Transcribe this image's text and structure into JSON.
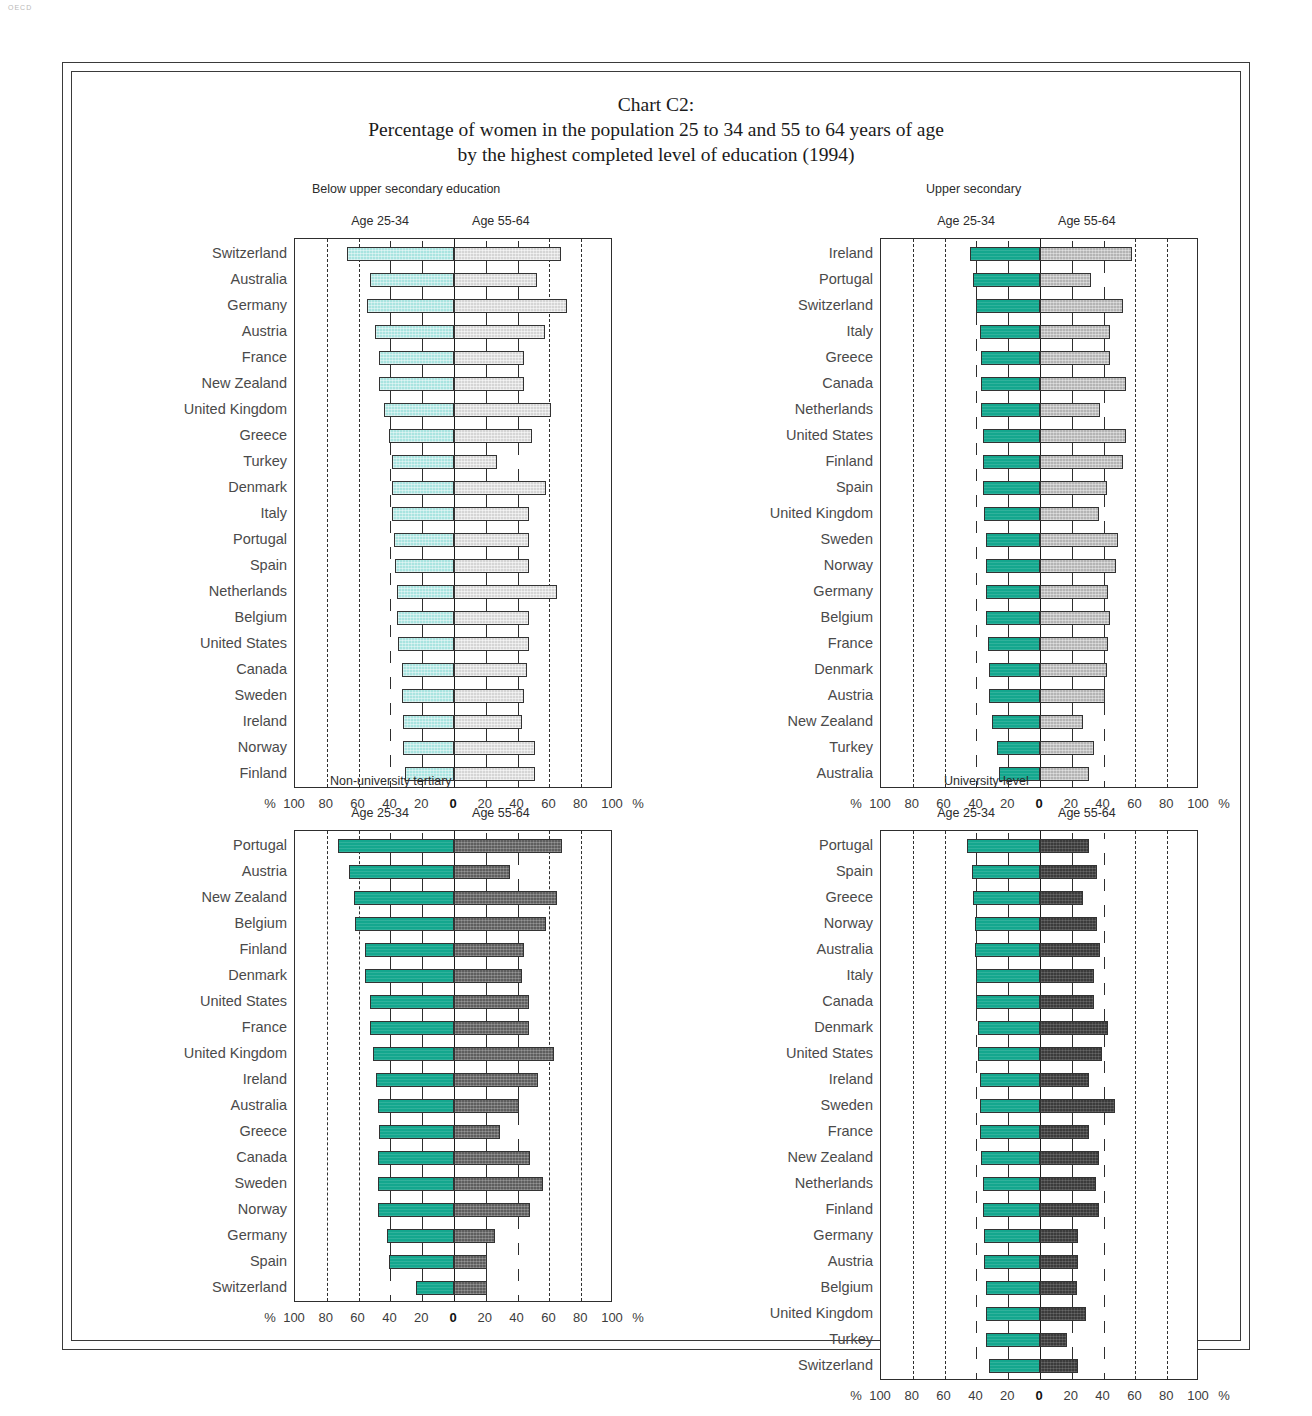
{
  "corner_mark": "OECD",
  "title": {
    "line1": "Chart C2:",
    "line2": "Percentage of women in the population 25 to 34 and 55 to 64 years of age",
    "line3": "by the highest completed level of education (1994)"
  },
  "axis": {
    "unit_left": "%",
    "unit_right": "%",
    "ticks": [
      "100",
      "80",
      "60",
      "40",
      "20",
      "0",
      "20",
      "40",
      "60",
      "80",
      "100"
    ],
    "tick_values": [
      -100,
      -80,
      -60,
      -40,
      -20,
      0,
      20,
      40,
      60,
      80,
      100
    ]
  },
  "legend": {
    "left": "Age 25-34",
    "right": "Age 55-64"
  },
  "colors": {
    "left_light": "#a9e4e0",
    "right_light": "#d5d5d5",
    "left_teal": "#14a78e",
    "right_mid": "#b4b4b4",
    "right_dark": "#5e5e5e",
    "right_very_dark": "#3b3b3b",
    "frame": "#3a3a3a",
    "label": "#4a4a4a"
  },
  "chart_data": [
    {
      "type": "bar",
      "orientation": "horizontal-diverging",
      "panel": "top-left",
      "title": "Below upper secondary education",
      "xlabel": "%",
      "ylabel": "",
      "xlim": [
        -100,
        100
      ],
      "grid": "dashed vertical at 20% steps",
      "legend_position": "above-plot",
      "left_series": {
        "name": "Age 25-34",
        "color": "#a9e4e0"
      },
      "right_series": {
        "name": "Age 55-64",
        "color": "#d5d5d5"
      },
      "categories": [
        "Switzerland",
        "Australia",
        "Germany",
        "Austria",
        "France",
        "New Zealand",
        "United Kingdom",
        "Greece",
        "Turkey",
        "Denmark",
        "Italy",
        "Portugal",
        "Spain",
        "Netherlands",
        "Belgium",
        "United States",
        "Canada",
        "Sweden",
        "Ireland",
        "Norway",
        "Finland"
      ],
      "age_25_34": [
        67,
        53,
        55,
        50,
        47,
        47,
        44,
        41,
        39,
        39,
        39,
        38,
        37,
        36,
        36,
        35,
        33,
        33,
        32,
        32,
        31
      ],
      "age_55_64": [
        67,
        52,
        71,
        57,
        44,
        44,
        61,
        49,
        27,
        58,
        47,
        47,
        47,
        65,
        47,
        47,
        46,
        44,
        43,
        51,
        51
      ]
    },
    {
      "type": "bar",
      "orientation": "horizontal-diverging",
      "panel": "top-right",
      "title": "Upper secondary",
      "xlabel": "%",
      "ylabel": "",
      "xlim": [
        -100,
        100
      ],
      "grid": "dashed vertical at 20% steps",
      "legend_position": "above-plot",
      "left_series": {
        "name": "Age 25-34",
        "color": "#14a78e"
      },
      "right_series": {
        "name": "Age 55-64",
        "color": "#b4b4b4"
      },
      "categories": [
        "Ireland",
        "Portugal",
        "Switzerland",
        "Italy",
        "Greece",
        "Canada",
        "Netherlands",
        "United States",
        "Finland",
        "Spain",
        "United Kingdom",
        "Sweden",
        "Norway",
        "Germany",
        "Belgium",
        "France",
        "Denmark",
        "Austria",
        "New Zealand",
        "Turkey",
        "Australia"
      ],
      "age_25_34": [
        44,
        42,
        40,
        38,
        37,
        37,
        37,
        36,
        36,
        36,
        35,
        34,
        34,
        34,
        34,
        33,
        32,
        32,
        30,
        27,
        26
      ],
      "age_55_64": [
        58,
        32,
        52,
        44,
        44,
        54,
        38,
        54,
        52,
        42,
        37,
        49,
        48,
        43,
        44,
        43,
        42,
        41,
        27,
        34,
        31
      ]
    },
    {
      "type": "bar",
      "orientation": "horizontal-diverging",
      "panel": "bottom-left",
      "title": "Non-university tertiary",
      "xlabel": "%",
      "ylabel": "",
      "xlim": [
        -100,
        100
      ],
      "grid": "dashed vertical at 20% steps",
      "legend_position": "above-plot",
      "left_series": {
        "name": "Age 25-34",
        "color": "#14a78e"
      },
      "right_series": {
        "name": "Age 55-64",
        "color": "#5e5e5e"
      },
      "categories": [
        "Portugal",
        "Austria",
        "New Zealand",
        "Belgium",
        "Finland",
        "Denmark",
        "United States",
        "France",
        "United Kingdom",
        "Ireland",
        "Australia",
        "Greece",
        "Canada",
        "Sweden",
        "Norway",
        "Germany",
        "Spain",
        "Switzerland"
      ],
      "age_25_34": [
        73,
        66,
        63,
        62,
        56,
        56,
        53,
        53,
        51,
        49,
        48,
        47,
        48,
        48,
        48,
        42,
        41,
        24
      ],
      "age_55_64": [
        68,
        35,
        65,
        58,
        44,
        43,
        47,
        47,
        63,
        53,
        41,
        29,
        48,
        56,
        48,
        26,
        21,
        21
      ]
    },
    {
      "type": "bar",
      "orientation": "horizontal-diverging",
      "panel": "bottom-right",
      "title": "University-level",
      "xlabel": "%",
      "ylabel": "",
      "xlim": [
        -100,
        100
      ],
      "grid": "dashed vertical at 20% steps",
      "legend_position": "above-plot",
      "left_series": {
        "name": "Age 25-34",
        "color": "#14a78e"
      },
      "right_series": {
        "name": "Age 55-64",
        "color": "#3b3b3b"
      },
      "categories": [
        "Portugal",
        "Spain",
        "Greece",
        "Norway",
        "Australia",
        "Italy",
        "Canada",
        "Denmark",
        "United States",
        "Ireland",
        "Sweden",
        "France",
        "New Zealand",
        "Netherlands",
        "Finland",
        "Germany",
        "Austria",
        "Belgium",
        "United Kingdom",
        "Turkey",
        "Switzerland"
      ],
      "age_25_34": [
        46,
        43,
        42,
        41,
        41,
        40,
        40,
        39,
        39,
        38,
        38,
        38,
        37,
        36,
        36,
        35,
        35,
        34,
        34,
        34,
        32
      ],
      "age_55_64": [
        31,
        36,
        27,
        36,
        38,
        34,
        34,
        43,
        39,
        31,
        47,
        31,
        37,
        35,
        37,
        24,
        24,
        23,
        29,
        17,
        24
      ]
    }
  ]
}
